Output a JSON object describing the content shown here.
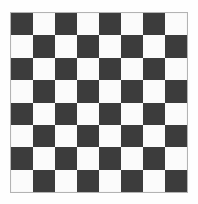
{
  "page": {
    "background_color": "#fefefe",
    "width": 198,
    "height": 204
  },
  "board": {
    "name": "checkerboard",
    "rows": 8,
    "columns": 8,
    "total_squares": 64,
    "dark_color": "#3c3c3c",
    "light_color": "#fbfbfb",
    "border_color": "#b3b3b3",
    "border_width": 1,
    "top_left_square": "dark",
    "bottom_right_square": "dark",
    "square_size": 22,
    "origin_x": 10,
    "origin_y": 12,
    "board_width": 178,
    "board_height": 181,
    "pattern": [
      [
        "dark",
        "light",
        "dark",
        "light",
        "dark",
        "light",
        "dark",
        "light"
      ],
      [
        "light",
        "dark",
        "light",
        "dark",
        "light",
        "dark",
        "light",
        "dark"
      ],
      [
        "dark",
        "light",
        "dark",
        "light",
        "dark",
        "light",
        "dark",
        "light"
      ],
      [
        "light",
        "dark",
        "light",
        "dark",
        "light",
        "dark",
        "light",
        "dark"
      ],
      [
        "dark",
        "light",
        "dark",
        "light",
        "dark",
        "light",
        "dark",
        "light"
      ],
      [
        "light",
        "dark",
        "light",
        "dark",
        "light",
        "dark",
        "light",
        "dark"
      ],
      [
        "dark",
        "light",
        "dark",
        "light",
        "dark",
        "light",
        "dark",
        "light"
      ],
      [
        "light",
        "dark",
        "light",
        "dark",
        "light",
        "dark",
        "light",
        "dark"
      ]
    ]
  }
}
